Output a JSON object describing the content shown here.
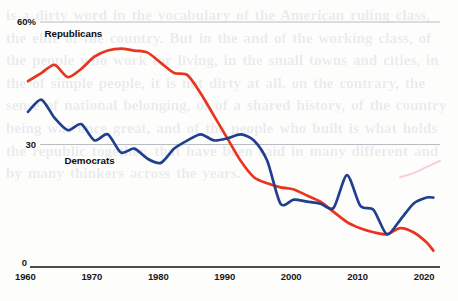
{
  "chart_data": {
    "type": "line",
    "title": "",
    "subtitle": "",
    "xlabel": "",
    "ylabel": "",
    "ylim": [
      0,
      60
    ],
    "xlim": [
      1960,
      2022
    ],
    "grid": true,
    "gridlines": [
      30,
      60
    ],
    "legend_position": "inline-annotation",
    "y_tick_labels": [
      "60%",
      "30",
      "0"
    ],
    "y_ticks": [
      60,
      30,
      0
    ],
    "x_tick_labels": [
      "1960",
      "1970",
      "1980",
      "1990",
      "2000",
      "2010",
      "2020"
    ],
    "x_ticks": [
      1960,
      1970,
      1980,
      1990,
      2000,
      2010,
      2020
    ],
    "series": [
      {
        "name": "Republicans",
        "color": "#e8351f",
        "label_text": "Republicans",
        "x": [
          1960,
          1962,
          1964,
          1966,
          1968,
          1970,
          1972,
          1974,
          1976,
          1978,
          1980,
          1982,
          1984,
          1986,
          1988,
          1990,
          1992,
          1994,
          1996,
          1998,
          2000,
          2002,
          2004,
          2006,
          2008,
          2010,
          2012,
          2014,
          2016,
          2018,
          2020,
          2021
        ],
        "values": [
          45.5,
          47.5,
          49.5,
          46.5,
          48.5,
          51.5,
          53.0,
          53.5,
          53.0,
          52.5,
          50.0,
          47.5,
          47.0,
          42.5,
          37.0,
          31.5,
          26.0,
          22.0,
          20.5,
          19.5,
          19.0,
          17.5,
          16.0,
          13.5,
          11.0,
          9.5,
          8.5,
          8.0,
          9.5,
          8.5,
          6.0,
          4.0
        ]
      },
      {
        "name": "Democrats",
        "color": "#1f3f8f",
        "label_text": "Democrats",
        "x": [
          1960,
          1962,
          1964,
          1966,
          1968,
          1970,
          1972,
          1974,
          1976,
          1978,
          1980,
          1982,
          1984,
          1986,
          1988,
          1990,
          1992,
          1994,
          1996,
          1998,
          2000,
          2002,
          2004,
          2006,
          2008,
          2010,
          2012,
          2014,
          2016,
          2018,
          2020,
          2021
        ],
        "values": [
          38.0,
          41.0,
          36.5,
          33.5,
          35.0,
          31.0,
          32.5,
          28.0,
          29.0,
          26.5,
          25.5,
          29.0,
          31.0,
          32.5,
          31.0,
          31.5,
          32.5,
          31.0,
          26.0,
          15.5,
          16.5,
          16.0,
          15.5,
          14.5,
          22.5,
          15.0,
          14.0,
          8.0,
          11.5,
          15.5,
          17.0,
          17.0
        ]
      },
      {
        "name": "trend-faint",
        "color": "#f0a8c8",
        "label_text": "",
        "x": [
          2016,
          2018,
          2020,
          2022
        ],
        "values": [
          22.0,
          23.0,
          24.5,
          26.0
        ]
      }
    ],
    "annotations": [
      {
        "text": "Republicans",
        "x": 1967,
        "y": 57
      },
      {
        "text": "Democrats",
        "x": 1970,
        "y": 26
      }
    ],
    "bleed_text": "is a dirty word in the vocabulary of the American ruling class, the elite of the country. But in the and of the working class, of the people who work for living, in the small towns and cities, in the of simple people, it is not dirty at all. on the contrary, the sense of national belonging, of of a shared history, of the country being was once great, and of the people who built is what holds the republic together. that have been said in many different and by many thinkers across the years."
  }
}
